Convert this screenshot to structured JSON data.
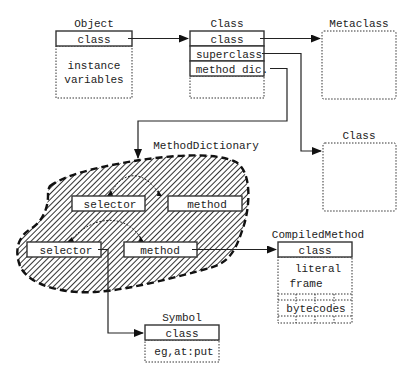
{
  "object": {
    "title": "Object",
    "rows": [
      "class"
    ],
    "body": [
      "instance",
      "variables"
    ]
  },
  "class_main": {
    "title": "Class",
    "rows": [
      "class",
      "superclass",
      "method dic."
    ]
  },
  "metaclass": {
    "title": "Metaclass"
  },
  "class_super": {
    "title": "Class"
  },
  "method_dictionary": {
    "title": "MethodDictionary",
    "entries": [
      {
        "selector": "selector",
        "method": "method"
      },
      {
        "selector": "selector",
        "method": "method"
      }
    ]
  },
  "compiled_method": {
    "title": "CompiledMethod",
    "rows": [
      "class"
    ],
    "body": [
      "literal",
      "frame"
    ],
    "bytecodes_label": "bytecodes"
  },
  "symbol": {
    "title": "Symbol",
    "rows": [
      "class"
    ],
    "body": [
      "eg,at:put"
    ]
  },
  "colors": {
    "ink": "#222222",
    "background": "#ffffff"
  }
}
